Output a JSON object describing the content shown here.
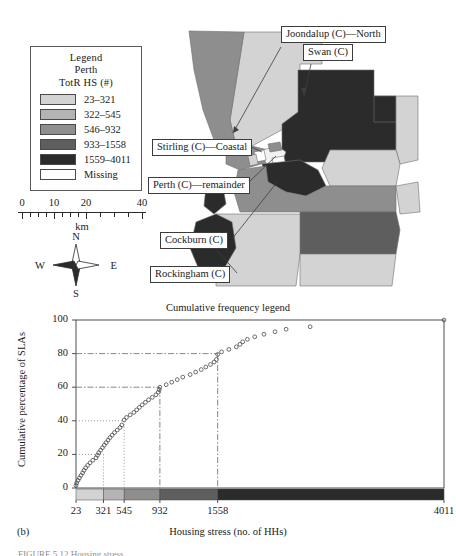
{
  "figure": {
    "panel_letter": "(b)",
    "cut_caption": "FIGURE 5.12  Housing stress"
  },
  "map": {
    "legend": {
      "title_lines": [
        "Legend",
        "Perth",
        "TotR HS (#)"
      ],
      "classes": [
        {
          "label": "23–321",
          "color": "#d3d3d3"
        },
        {
          "label": "322–545",
          "color": "#b4b4b4"
        },
        {
          "label": "546–932",
          "color": "#8e8e8e"
        },
        {
          "label": "933–1558",
          "color": "#5e5e5e"
        },
        {
          "label": "1559–4011",
          "color": "#2b2b2b"
        },
        {
          "label": "Missing",
          "color": "#ffffff"
        }
      ]
    },
    "scalebar": {
      "ticks": [
        "0",
        "10",
        "20",
        "40"
      ],
      "unit": "km"
    },
    "compass": {
      "n": "N",
      "s": "S",
      "e": "E",
      "w": "W"
    },
    "callouts": [
      {
        "name": "joondalup",
        "text": "Joondalup (C)—North"
      },
      {
        "name": "swan",
        "text": "Swan (C)"
      },
      {
        "name": "stirling",
        "text": "Stirling (C)—Coastal"
      },
      {
        "name": "perth-rem",
        "text": "Perth (C)—remainder"
      },
      {
        "name": "cockburn",
        "text": "Cockburn (C)"
      },
      {
        "name": "rockingham",
        "text": "Rockingham (C)"
      }
    ]
  },
  "chart_data": {
    "type": "scatter",
    "title": "Cumulative frequency legend",
    "xlabel": "Housing stress (no. of HHs)",
    "ylabel": "Cumulative percentage of SLAs",
    "xlim": [
      23,
      4011
    ],
    "ylim": [
      0,
      100
    ],
    "yticks": [
      0,
      20,
      40,
      60,
      80,
      100
    ],
    "xticks": [
      23,
      321,
      545,
      932,
      1558,
      4011
    ],
    "xtick_labels": [
      "23",
      "321",
      "545",
      "932",
      "1558",
      "4011"
    ],
    "grid": false,
    "legend_position": "none",
    "class_breaks": [
      23,
      321,
      545,
      932,
      1558,
      4011
    ],
    "class_colors": [
      "#d3d3d3",
      "#b4b4b4",
      "#8e8e8e",
      "#5e5e5e",
      "#2b2b2b"
    ],
    "reference_lines": [
      {
        "y": 80,
        "x": 1558,
        "style": "dash-dot"
      },
      {
        "y": 60,
        "x": 932,
        "style": "dash-dot"
      },
      {
        "y": 40,
        "x": 545,
        "style": "dotted"
      },
      {
        "y": 20,
        "x": 321,
        "style": "dotted"
      }
    ],
    "points": [
      [
        23,
        1.5
      ],
      [
        30,
        3.0
      ],
      [
        45,
        4.5
      ],
      [
        60,
        6.0
      ],
      [
        78,
        7.5
      ],
      [
        95,
        9.0
      ],
      [
        110,
        10.5
      ],
      [
        128,
        12.0
      ],
      [
        150,
        13.5
      ],
      [
        175,
        15.0
      ],
      [
        205,
        16.5
      ],
      [
        240,
        18.0
      ],
      [
        255,
        19.5
      ],
      [
        270,
        21.0
      ],
      [
        290,
        22.5
      ],
      [
        310,
        24.0
      ],
      [
        330,
        25.5
      ],
      [
        350,
        27.0
      ],
      [
        370,
        28.5
      ],
      [
        392,
        30.0
      ],
      [
        415,
        31.5
      ],
      [
        440,
        33.0
      ],
      [
        470,
        34.5
      ],
      [
        500,
        36.0
      ],
      [
        520,
        37.5
      ],
      [
        545,
        40.5
      ],
      [
        570,
        42.0
      ],
      [
        610,
        43.5
      ],
      [
        650,
        45.0
      ],
      [
        680,
        46.5
      ],
      [
        710,
        48.0
      ],
      [
        740,
        49.5
      ],
      [
        775,
        51.0
      ],
      [
        810,
        52.5
      ],
      [
        850,
        54.0
      ],
      [
        890,
        55.5
      ],
      [
        915,
        57.0
      ],
      [
        925,
        58.5
      ],
      [
        932,
        60.0
      ],
      [
        1000,
        61.5
      ],
      [
        1060,
        63.0
      ],
      [
        1120,
        64.5
      ],
      [
        1180,
        66.0
      ],
      [
        1260,
        67.5
      ],
      [
        1320,
        69.0
      ],
      [
        1380,
        70.5
      ],
      [
        1430,
        72.0
      ],
      [
        1480,
        73.5
      ],
      [
        1520,
        75.0
      ],
      [
        1545,
        76.5
      ],
      [
        1558,
        79.5
      ],
      [
        1600,
        81.0
      ],
      [
        1680,
        82.5
      ],
      [
        1760,
        84.0
      ],
      [
        1800,
        85.5
      ],
      [
        1830,
        87.0
      ],
      [
        1880,
        88.5
      ],
      [
        1960,
        90.0
      ],
      [
        2060,
        91.5
      ],
      [
        2180,
        93.0
      ],
      [
        2300,
        94.5
      ],
      [
        2560,
        96.0
      ],
      [
        4011,
        100.0
      ]
    ]
  }
}
